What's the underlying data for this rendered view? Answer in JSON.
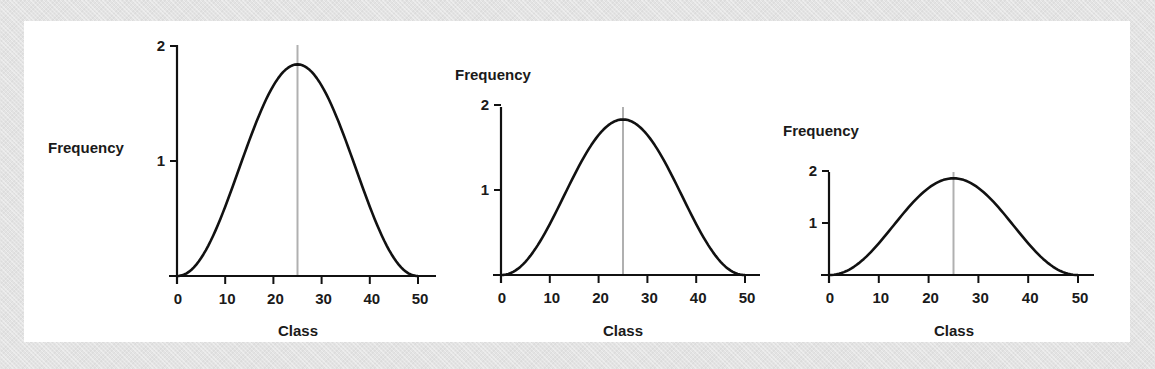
{
  "figure": {
    "background_color": "#e3e3e3",
    "panel_color": "#ffffff",
    "curve_color": "#111111",
    "mean_line_color": "#b0b0b0"
  },
  "charts": [
    {
      "ylabel": "Frequency",
      "xlabel": "Class",
      "xticks": [
        "0",
        "10",
        "20",
        "30",
        "40",
        "50"
      ],
      "yticks": [
        "1",
        "2"
      ]
    },
    {
      "ylabel": "Frequency",
      "xlabel": "Class",
      "xticks": [
        "0",
        "10",
        "20",
        "30",
        "40",
        "50"
      ],
      "yticks": [
        "1",
        "2"
      ]
    },
    {
      "ylabel": "Frequency",
      "xlabel": "Class",
      "xticks": [
        "0",
        "10",
        "20",
        "30",
        "40",
        "50"
      ],
      "yticks": [
        "1",
        "2"
      ]
    }
  ],
  "chart_data": [
    {
      "type": "line",
      "title": "",
      "xlabel": "Class",
      "ylabel": "Frequency",
      "xlim": [
        0,
        50
      ],
      "ylim": [
        0,
        2
      ],
      "x_ticks": [
        0,
        10,
        20,
        30,
        40,
        50
      ],
      "y_ticks": [
        1,
        2
      ],
      "grid": false,
      "series": [
        {
          "name": "distribution",
          "x": [
            0,
            5,
            10,
            15,
            20,
            25,
            30,
            35,
            40,
            45,
            50
          ],
          "values": [
            0,
            0.18,
            0.56,
            1.12,
            1.62,
            1.84,
            1.62,
            1.12,
            0.56,
            0.18,
            0
          ]
        }
      ],
      "annotations": [
        {
          "type": "vertical_line",
          "x": 25,
          "label": "mean"
        }
      ],
      "layout_note": "tall y-axis (large vertical scale)"
    },
    {
      "type": "line",
      "title": "",
      "xlabel": "Class",
      "ylabel": "Frequency",
      "xlim": [
        0,
        50
      ],
      "ylim": [
        0,
        2
      ],
      "x_ticks": [
        0,
        10,
        20,
        30,
        40,
        50
      ],
      "y_ticks": [
        1,
        2
      ],
      "grid": false,
      "series": [
        {
          "name": "distribution",
          "x": [
            0,
            5,
            10,
            15,
            20,
            25,
            30,
            35,
            40,
            45,
            50
          ],
          "values": [
            0,
            0.17,
            0.56,
            1.11,
            1.6,
            1.83,
            1.6,
            1.11,
            0.56,
            0.17,
            0
          ]
        }
      ],
      "annotations": [
        {
          "type": "vertical_line",
          "x": 25,
          "label": "mean"
        }
      ],
      "layout_note": "medium y-axis scale"
    },
    {
      "type": "line",
      "title": "",
      "xlabel": "Class",
      "ylabel": "Frequency",
      "xlim": [
        0,
        50
      ],
      "ylim": [
        0,
        2
      ],
      "x_ticks": [
        0,
        10,
        20,
        30,
        40,
        50
      ],
      "y_ticks": [
        1,
        2
      ],
      "grid": false,
      "series": [
        {
          "name": "distribution",
          "x": [
            0,
            5,
            10,
            15,
            20,
            25,
            30,
            35,
            40,
            45,
            50
          ],
          "values": [
            0,
            0.18,
            0.57,
            1.13,
            1.64,
            1.86,
            1.64,
            1.13,
            0.57,
            0.18,
            0
          ]
        }
      ],
      "annotations": [
        {
          "type": "vertical_line",
          "x": 25,
          "label": "mean"
        }
      ],
      "layout_note": "compressed y-axis scale"
    }
  ]
}
